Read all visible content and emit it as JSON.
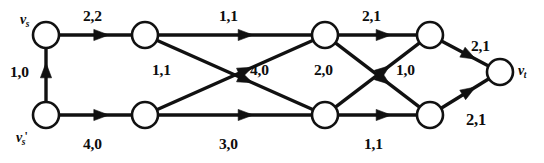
{
  "figure": {
    "width": 544,
    "height": 163,
    "background": "#ffffff",
    "ink_color": "#111111"
  },
  "nodes": [
    {
      "id": "vs",
      "label_main": "v",
      "label_sub": "s",
      "label_prime": "",
      "x": 46,
      "y": 35,
      "r": 13,
      "label_x": 20,
      "label_y": 13
    },
    {
      "id": "t2",
      "label_main": "",
      "label_sub": "",
      "label_prime": "",
      "x": 145,
      "y": 35,
      "r": 13,
      "label_x": 0,
      "label_y": 0
    },
    {
      "id": "t3",
      "label_main": "",
      "label_sub": "",
      "label_prime": "",
      "x": 325,
      "y": 35,
      "r": 13,
      "label_x": 0,
      "label_y": 0
    },
    {
      "id": "t4",
      "label_main": "",
      "label_sub": "",
      "label_prime": "",
      "x": 430,
      "y": 35,
      "r": 13,
      "label_x": 0,
      "label_y": 0
    },
    {
      "id": "vsp",
      "label_main": "v",
      "label_sub": "s",
      "label_prime": "'",
      "x": 46,
      "y": 115,
      "r": 13,
      "label_x": 16,
      "label_y": 130
    },
    {
      "id": "b2",
      "label_main": "",
      "label_sub": "",
      "label_prime": "",
      "x": 145,
      "y": 115,
      "r": 13,
      "label_x": 0,
      "label_y": 0
    },
    {
      "id": "b3",
      "label_main": "",
      "label_sub": "",
      "label_prime": "",
      "x": 325,
      "y": 115,
      "r": 13,
      "label_x": 0,
      "label_y": 0
    },
    {
      "id": "b4",
      "label_main": "",
      "label_sub": "",
      "label_prime": "",
      "x": 430,
      "y": 115,
      "r": 13,
      "label_x": 0,
      "label_y": 0
    },
    {
      "id": "vt",
      "label_main": "v",
      "label_sub": "t",
      "label_prime": "",
      "x": 500,
      "y": 72,
      "r": 13,
      "label_x": 518,
      "label_y": 64
    }
  ],
  "edges": [
    {
      "id": "e-vsp-vs",
      "from": "vsp",
      "to": "vs",
      "capacity": 1,
      "flow": 0,
      "label": "1,0",
      "label_x": 10,
      "label_y": 64,
      "bold": false
    },
    {
      "id": "e-vs-t2",
      "from": "vs",
      "to": "t2",
      "capacity": 2,
      "flow": 2,
      "label": "2,2",
      "label_x": 83,
      "label_y": 8,
      "bold": false
    },
    {
      "id": "e-t2-t3",
      "from": "t2",
      "to": "t3",
      "capacity": 1,
      "flow": 1,
      "label": "1,1",
      "label_x": 219,
      "label_y": 8,
      "bold": false
    },
    {
      "id": "e-t2-b3",
      "from": "t2",
      "to": "b3",
      "capacity": 1,
      "flow": 1,
      "label": "1,1",
      "label_x": 152,
      "label_y": 62,
      "bold": false
    },
    {
      "id": "e-b2-t3",
      "from": "b2",
      "to": "t3",
      "capacity": 4,
      "flow": 0,
      "label": "4,0",
      "label_x": 250,
      "label_y": 62,
      "bold": false
    },
    {
      "id": "e-vsp-b2",
      "from": "vsp",
      "to": "b2",
      "capacity": 4,
      "flow": 0,
      "label": "4,0",
      "label_x": 83,
      "label_y": 136,
      "bold": false
    },
    {
      "id": "e-b2-b3",
      "from": "b2",
      "to": "b3",
      "capacity": 3,
      "flow": 0,
      "label": "3,0",
      "label_x": 219,
      "label_y": 136,
      "bold": false
    },
    {
      "id": "e-t3-t4",
      "from": "t3",
      "to": "t4",
      "capacity": 2,
      "flow": 1,
      "label": "2,1",
      "label_x": 362,
      "label_y": 8,
      "bold": false
    },
    {
      "id": "e-t3-b4",
      "from": "t3",
      "to": "b4",
      "capacity": 2,
      "flow": 0,
      "label": "2,0",
      "label_x": 314,
      "label_y": 62,
      "bold": false
    },
    {
      "id": "e-b3-t4",
      "from": "b3",
      "to": "t4",
      "capacity": 1,
      "flow": 0,
      "label": "1,0",
      "label_x": 396,
      "label_y": 62,
      "bold": false
    },
    {
      "id": "e-b3-b4",
      "from": "b3",
      "to": "b4",
      "capacity": 1,
      "flow": 1,
      "label": "1,1",
      "label_x": 364,
      "label_y": 136,
      "bold": false
    },
    {
      "id": "e-t4-vt",
      "from": "t4",
      "to": "vt",
      "capacity": 2,
      "flow": 1,
      "label": "2,1",
      "label_x": 471,
      "label_y": 38,
      "bold": false
    },
    {
      "id": "e-b4-vt",
      "from": "b4",
      "to": "vt",
      "capacity": 2,
      "flow": 1,
      "label": "2,1",
      "label_x": 466,
      "label_y": 112,
      "bold": true
    }
  ]
}
